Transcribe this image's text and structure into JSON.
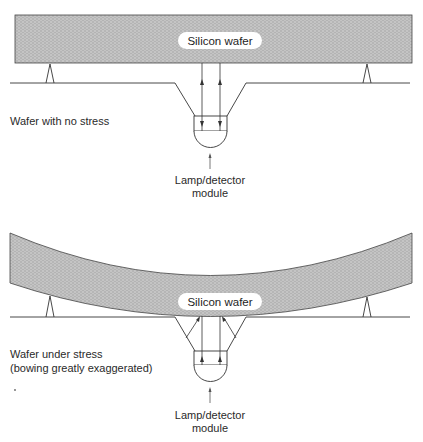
{
  "colors": {
    "wafer_fill": "#bdbdbd",
    "line": "#333333",
    "text": "#2a2a2a",
    "background": "#ffffff"
  },
  "panels": [
    {
      "id": "no-stress",
      "wafer_label": "Silicon wafer",
      "caption_lines": [
        "Wafer with no stress"
      ],
      "module_label_lines": [
        "Lamp/detector",
        "module"
      ]
    },
    {
      "id": "under-stress",
      "wafer_label": "Silicon wafer",
      "caption_lines": [
        "Wafer under stress",
        "(bowing greatly exaggerated)"
      ],
      "module_label_lines": [
        "Lamp/detector",
        "module"
      ]
    }
  ]
}
